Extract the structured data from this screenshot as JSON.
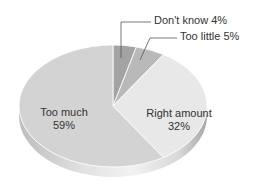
{
  "chart_data": {
    "type": "pie",
    "title": "",
    "style": "3d-tilted",
    "start_angle": "12 o'clock",
    "direction": "clockwise",
    "slices": [
      {
        "label": "Don't know",
        "value": 4,
        "display": "Don't know  4%",
        "color": "#a3a3a3",
        "label_position": "outside-leader"
      },
      {
        "label": "Too little",
        "value": 5,
        "display": "Too little  5%",
        "color": "#b9b9b9",
        "label_position": "outside-leader"
      },
      {
        "label": "Right amount",
        "value": 32,
        "display": "32%",
        "color": "#e8e8e8",
        "label_position": "inside"
      },
      {
        "label": "Too much",
        "value": 59,
        "display": "59%",
        "color": "#d3d3d3",
        "label_position": "inside"
      }
    ],
    "legend": "none"
  },
  "labels": {
    "dont_know": "Don't know  4%",
    "too_little": "Too little  5%",
    "right_amount_name": "Right amount",
    "right_amount_pct": "32%",
    "too_much_name": "Too much",
    "too_much_pct": "59%"
  }
}
